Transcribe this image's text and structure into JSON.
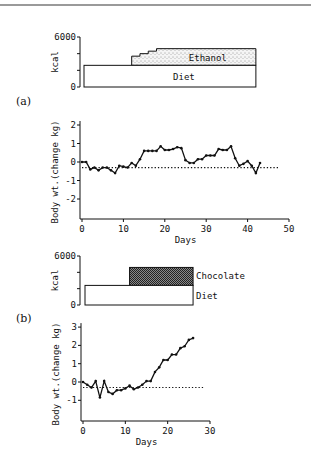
{
  "figure": {
    "panels": [
      "(a)",
      "(b)"
    ]
  },
  "chart_data": [
    {
      "panel": "(a)",
      "type": "area",
      "title": "",
      "ylabel": "kcal",
      "xlabel": "",
      "ylim": [
        0,
        6000
      ],
      "yticks": [
        0,
        2000,
        4000,
        6000
      ],
      "ytick_labels": [
        "0",
        "",
        "",
        "6000"
      ],
      "xlim": [
        0,
        50
      ],
      "series": [
        {
          "name": "Diet",
          "label": "Diet",
          "fill": "white",
          "start_day": 0,
          "end_day": 42,
          "kcal": 2600
        },
        {
          "name": "Ethanol",
          "label": "Ethanol",
          "fill": "stipple",
          "start_day": 12,
          "end_day": 42,
          "steps": [
            {
              "day": 12,
              "kcal": 3700
            },
            {
              "day": 14,
              "kcal": 4000
            },
            {
              "day": 16,
              "kcal": 4300
            },
            {
              "day": 18,
              "kcal": 4600
            }
          ]
        }
      ]
    },
    {
      "panel": "(a)",
      "type": "line",
      "title": "",
      "ylabel": "Body wt.(change kg)",
      "xlabel": "Days",
      "xlim": [
        0,
        50
      ],
      "ylim": [
        -3,
        2
      ],
      "xticks": [
        0,
        10,
        20,
        30,
        40,
        50
      ],
      "yticks": [
        -2,
        -1,
        0,
        1,
        2
      ],
      "baseline": -0.3,
      "series": [
        {
          "name": "Body weight change",
          "x": [
            0,
            1,
            2,
            3,
            4,
            5,
            6,
            7,
            8,
            9,
            10,
            11,
            12,
            13,
            14,
            15,
            16,
            17,
            18,
            19,
            20,
            21,
            22,
            23,
            24,
            25,
            26,
            27,
            28,
            29,
            30,
            31,
            32,
            33,
            34,
            35,
            36,
            37,
            38,
            39,
            40,
            41,
            42,
            43
          ],
          "y": [
            0.0,
            0.0,
            -0.4,
            -0.3,
            -0.45,
            -0.3,
            -0.3,
            -0.45,
            -0.6,
            -0.2,
            -0.25,
            -0.3,
            -0.05,
            -0.2,
            0.15,
            0.6,
            0.6,
            0.6,
            0.6,
            0.85,
            0.65,
            0.65,
            0.7,
            0.8,
            0.75,
            0.1,
            -0.05,
            -0.05,
            0.15,
            0.15,
            0.35,
            0.35,
            0.35,
            0.7,
            0.65,
            0.65,
            0.85,
            0.2,
            -0.2,
            -0.1,
            0.05,
            -0.2,
            -0.6,
            -0.05
          ]
        }
      ]
    },
    {
      "panel": "(b)",
      "type": "area",
      "title": "",
      "ylabel": "kcal",
      "xlabel": "",
      "ylim": [
        0,
        6000
      ],
      "yticks": [
        0,
        2000,
        4000,
        6000
      ],
      "ytick_labels": [
        "0",
        "",
        "",
        "6000"
      ],
      "xlim": [
        0,
        30
      ],
      "series": [
        {
          "name": "Diet",
          "label": "Diet",
          "fill": "white",
          "start_day": 0,
          "end_day": 26,
          "kcal": 2400
        },
        {
          "name": "Chocolate",
          "label": "Chocolate",
          "fill": "crosshatch",
          "start_day": 11,
          "end_day": 26,
          "kcal": 4600
        }
      ]
    },
    {
      "panel": "(b)",
      "type": "line",
      "title": "",
      "ylabel": "Body wt.(change kg)",
      "xlabel": "Days",
      "xlim": [
        0,
        30
      ],
      "ylim": [
        -2,
        3
      ],
      "xticks": [
        0,
        10,
        20,
        30
      ],
      "yticks": [
        -1,
        0,
        1,
        2,
        3
      ],
      "baseline": -0.3,
      "series": [
        {
          "name": "Body weight change",
          "x": [
            0,
            1,
            2,
            3,
            4,
            5,
            6,
            7,
            8,
            9,
            10,
            11,
            12,
            13,
            14,
            15,
            16,
            17,
            18,
            19,
            20,
            21,
            22,
            23,
            24,
            25,
            26
          ],
          "y": [
            0.0,
            -0.15,
            -0.3,
            0.05,
            -0.85,
            0.05,
            -0.55,
            -0.65,
            -0.45,
            -0.45,
            -0.35,
            -0.2,
            -0.4,
            -0.3,
            -0.15,
            0.05,
            0.05,
            0.55,
            0.8,
            1.2,
            1.2,
            1.5,
            1.5,
            1.85,
            1.95,
            2.3,
            2.4
          ]
        }
      ]
    }
  ]
}
